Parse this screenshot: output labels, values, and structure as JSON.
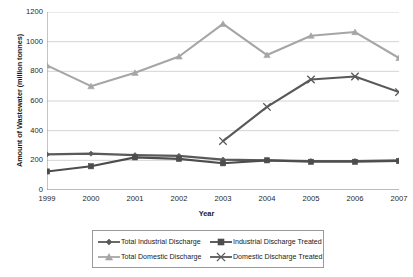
{
  "chart_data": {
    "type": "line",
    "title": "",
    "xlabel": "Year",
    "ylabel": "Amount of Wastewater (million tonnes)",
    "categories": [
      "1999",
      "2000",
      "2001",
      "2002",
      "2003",
      "2004",
      "2005",
      "2006",
      "2007"
    ],
    "x": [
      1999,
      2000,
      2001,
      2002,
      2003,
      2004,
      2005,
      2006,
      2007
    ],
    "ylim": [
      0,
      1200
    ],
    "yticks": [
      0,
      200,
      400,
      600,
      800,
      1000,
      1200
    ],
    "grid": "horizontal",
    "legend_position": "bottom",
    "series": [
      {
        "name": "Total Industrial Discharge",
        "marker": "diamond",
        "color": "#5a5a5a",
        "values": [
          240,
          245,
          235,
          230,
          205,
          200,
          195,
          195,
          200
        ]
      },
      {
        "name": "Industrial Discharge Treated",
        "marker": "square",
        "color": "#4d4d4d",
        "values": [
          125,
          160,
          220,
          210,
          180,
          200,
          190,
          190,
          195
        ]
      },
      {
        "name": "Total Domestic Discharge",
        "marker": "triangle",
        "color": "#a6a6a6",
        "values": [
          840,
          700,
          790,
          900,
          1120,
          910,
          1040,
          1065,
          890
        ]
      },
      {
        "name": "Domestic Discharge Treated",
        "marker": "cross",
        "color": "#595959",
        "values": [
          null,
          null,
          null,
          null,
          330,
          560,
          745,
          765,
          660
        ]
      }
    ]
  },
  "axis": {
    "y_title": "Amount of Wastewater (million tonnes)",
    "x_title": "Year",
    "y_labels": [
      "1200",
      "1000",
      "800",
      "600",
      "400",
      "200",
      "0"
    ],
    "x_labels": [
      "1999",
      "2000",
      "2001",
      "2002",
      "2003",
      "2004",
      "2005",
      "2006",
      "2007"
    ]
  },
  "legend": {
    "items": [
      {
        "label": "Total Industrial Discharge",
        "marker": "diamond",
        "color": "#5a5a5a"
      },
      {
        "label": "Industrial Discharge Treated",
        "marker": "square",
        "color": "#4d4d4d"
      },
      {
        "label": "Total Domestic Discharge",
        "marker": "triangle",
        "color": "#a6a6a6"
      },
      {
        "label": "Domestic Discharge Treated",
        "marker": "cross",
        "color": "#595959"
      }
    ]
  },
  "colors": {
    "grid": "#c8c8c8",
    "axis": "#8c8c8c",
    "text": "#1a1a1a",
    "background": "#ffffff"
  }
}
